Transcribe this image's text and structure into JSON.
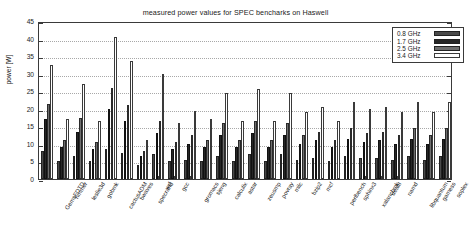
{
  "chart_data": {
    "type": "bar",
    "title": "measured power values for SPEC bencharks on Haswell",
    "xlabel": "",
    "ylabel": "power [W]",
    "ylim": [
      0,
      45
    ],
    "ytick_step": 5,
    "yticks": [
      "0",
      "5",
      "10",
      "15",
      "20",
      "25",
      "30",
      "35",
      "40",
      "45"
    ],
    "grid": true,
    "legend_position": "top-right",
    "categories": [
      "GemsFDTD",
      "hmmer",
      "leslie3d",
      "gobmk",
      "cactusADM",
      "bwaves",
      "specrand",
      "wrf",
      "gcc",
      "gromacs",
      "sjeng",
      "calculix",
      "astar",
      "zeusmp",
      "povray",
      "milc",
      "bzip2",
      "mcf",
      "perlbench",
      "sphinx3",
      "xalancbmk",
      "dealII",
      "namd",
      "libquantum",
      "gamess",
      "soplex"
    ],
    "series": [
      {
        "name": "0.8 GHz",
        "color": "#4a4a4a",
        "values": [
          8.0,
          5.0,
          6.5,
          5.0,
          8.5,
          7.5,
          4.0,
          7.0,
          5.0,
          5.5,
          5.0,
          6.5,
          5.0,
          7.0,
          5.0,
          7.0,
          5.5,
          6.0,
          5.0,
          6.5,
          6.0,
          6.0,
          5.5,
          6.5,
          5.5,
          6.5
        ]
      },
      {
        "name": "1.7 GHz",
        "color": "#262626",
        "values": [
          17.0,
          9.0,
          13.5,
          8.5,
          20.0,
          16.5,
          6.5,
          13.0,
          8.5,
          10.0,
          9.0,
          12.5,
          9.0,
          13.0,
          9.0,
          12.5,
          10.0,
          11.0,
          9.0,
          11.5,
          10.5,
          11.0,
          10.0,
          11.5,
          10.0,
          11.5
        ]
      },
      {
        "name": "2.5 GHz",
        "color": "#6e6e6e",
        "values": [
          21.5,
          11.0,
          17.5,
          10.5,
          26.0,
          21.0,
          8.0,
          16.5,
          10.5,
          12.5,
          11.0,
          16.0,
          11.0,
          16.5,
          11.0,
          16.0,
          12.5,
          13.5,
          11.0,
          14.5,
          13.0,
          13.5,
          12.5,
          14.5,
          12.5,
          14.5
        ]
      },
      {
        "name": "3.4 GHz",
        "color": "#ffffff",
        "values": [
          32.5,
          17.0,
          27.0,
          16.5,
          40.5,
          33.5,
          11.0,
          30.0,
          16.0,
          19.5,
          17.0,
          24.5,
          16.5,
          25.5,
          16.5,
          24.5,
          19.0,
          20.5,
          16.5,
          22.0,
          20.0,
          20.5,
          19.0,
          22.0,
          19.0,
          22.0
        ]
      }
    ]
  }
}
